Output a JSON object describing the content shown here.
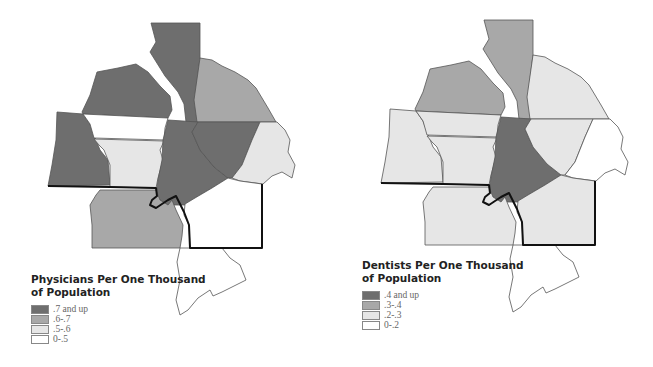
{
  "maps": [
    {
      "id": "physicians",
      "legend": {
        "title_line1": "Physicians Per One Thousand",
        "title_line2": "of Population",
        "items": [
          {
            "label": ".7 and up",
            "color": "#6e6e6e"
          },
          {
            "label": ".6-.7",
            "color": "#a8a8a8"
          },
          {
            "label": ".5-.6",
            "color": "#e6e6e6"
          },
          {
            "label": "0-.5",
            "color": "#ffffff"
          }
        ]
      },
      "regions": {
        "north_strip": ".7 and up",
        "northwest": ".7 and up",
        "northeast": ".6-.7",
        "west": ".7 and up",
        "central_band": "0-.5",
        "central_west": ".5-.6",
        "center": ".7 and up",
        "east_center": ".7 and up",
        "far_east": ".5-.6",
        "southeast": "0-.5",
        "southwest": ".6-.7",
        "south": "0-.5"
      }
    },
    {
      "id": "dentists",
      "legend": {
        "title_line1": "Dentists Per One Thousand",
        "title_line2": "of Population",
        "items": [
          {
            "label": ".4 and up",
            "color": "#6e6e6e"
          },
          {
            "label": ".3-.4",
            "color": "#a8a8a8"
          },
          {
            "label": ".2-.3",
            "color": "#e6e6e6"
          },
          {
            "label": "0-.2",
            "color": "#ffffff"
          }
        ]
      },
      "regions": {
        "north_strip": ".3-.4",
        "northwest": ".3-.4",
        "northeast": ".2-.3",
        "west": ".2-.3",
        "central_band": ".2-.3",
        "central_west": ".2-.3",
        "center": ".4 and up",
        "east_center": ".2-.3",
        "far_east": "0-.2",
        "southeast": ".2-.3",
        "southwest": ".2-.3",
        "south": "0-.2"
      }
    }
  ],
  "colors": {
    "dark": "#6e6e6e",
    "medium": "#a8a8a8",
    "light": "#e6e6e6",
    "white": "#ffffff"
  }
}
